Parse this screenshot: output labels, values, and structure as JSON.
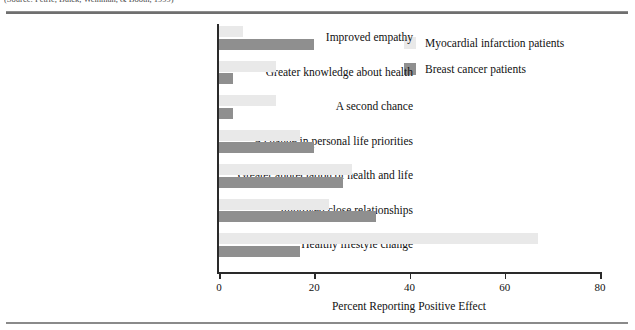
{
  "figure": {
    "caption_sliver": "(Source: Petrie, Buick, Weinman, & Booth, 1999)",
    "axis_spine_color": "#2a2a2a",
    "rule_color": "#6f6f6f"
  },
  "legend": {
    "position": "top-right",
    "items": [
      {
        "label": "Myocardial infarction patients",
        "color": "#e9e9e9",
        "swatch_name": "legend-swatch-myocardial"
      },
      {
        "label": "Breast cancer patients",
        "color": "#8f8f8f",
        "swatch_name": "legend-swatch-breast"
      }
    ]
  },
  "chart_data": {
    "type": "bar",
    "orientation": "horizontal",
    "title": "",
    "subtitle": "",
    "xlabel": "Percent Reporting Positive Effect",
    "ylabel": "",
    "xlim": [
      0,
      80
    ],
    "xticks": [
      0,
      20,
      40,
      60,
      80
    ],
    "xtick_labels": [
      "0",
      "20",
      "40",
      "60",
      "80"
    ],
    "grid": false,
    "legend_position": "top-right",
    "categories": [
      "Improved empathy",
      "Greater knowledge about health",
      "A second chance",
      "A change in personal life priorities",
      "Greater appreciation of health and life",
      "Improved close relationships",
      "Healthy lifestyle change"
    ],
    "series": [
      {
        "name": "Myocardial infarction patients",
        "color": "#e9e9e9",
        "values": [
          5,
          12,
          12,
          17,
          28,
          23,
          67
        ]
      },
      {
        "name": "Breast cancer patients",
        "color": "#8f8f8f",
        "values": [
          20,
          3,
          3,
          20,
          26,
          33,
          17
        ]
      }
    ]
  }
}
